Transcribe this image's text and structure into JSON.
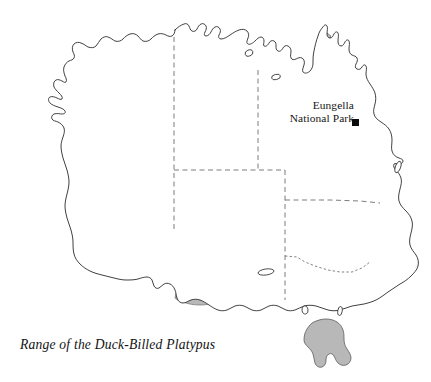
{
  "figure": {
    "caption": "Range of the Duck-Billed Platypus",
    "subject": "Duck-Billed Platypus",
    "region": "Australia"
  },
  "annotations": {
    "site": {
      "name_line1": "Eungella",
      "name_line2": "National Park",
      "marker_icon": "filled-square-marker",
      "marker_color": "#0a0a0a"
    }
  },
  "legend_colors": {
    "range_fill": "#b8b8b8",
    "range_outline": "#6e6e6e",
    "coastline": "#2b2b2b",
    "state_border": "#5a5a5a",
    "land_fill": "#ffffff",
    "background": "#ffffff"
  },
  "map_features": {
    "mainland_label": "australia-mainland-coastline",
    "tasmania_label": "tasmania-coastline",
    "range_label": "platypus-range-shading",
    "state_borders_label": "state-territory-borders",
    "islands": [
      "groote-eylandt",
      "mornington-island",
      "fraser-island",
      "kangaroo-island",
      "king-island",
      "flinders-island"
    ]
  }
}
